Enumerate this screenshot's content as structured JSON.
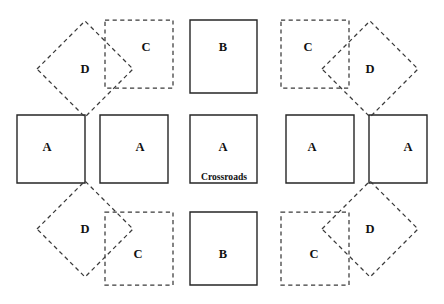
{
  "figure": {
    "name": "crossroads-tiling-diagram",
    "width": 444,
    "height": 304,
    "background_color": "#ffffff",
    "solid_stroke_color": "#262626",
    "dashed_stroke_color": "#3a3a3a",
    "label_color": "#111111",
    "caption": {
      "text": "Crossroads",
      "x": 224,
      "y": 178
    },
    "groups": [
      {
        "name": "left-group",
        "shapes": [
          {
            "id": "left-square-a-west",
            "label": "A",
            "style": "solid",
            "kind": "square",
            "points": "17,115 85,115 85,183 17,183",
            "label_x": 47,
            "label_y": 148
          },
          {
            "id": "left-square-a-east",
            "label": "A",
            "style": "solid",
            "kind": "square",
            "points": "100,115 168,115 168,183 100,183",
            "label_x": 140,
            "label_y": 148
          },
          {
            "id": "left-diamond-d-top",
            "label": "D",
            "style": "dashed",
            "kind": "diamond",
            "points": "37,69 85,21 133,69 85,117",
            "label_x": 85,
            "label_y": 70
          },
          {
            "id": "left-diamond-d-bottom",
            "label": "D",
            "style": "dashed",
            "kind": "diamond",
            "points": "37,229 85,181 133,229 85,277",
            "label_x": 85,
            "label_y": 230
          },
          {
            "id": "left-square-c-top",
            "label": "C",
            "style": "dashed",
            "kind": "square",
            "points": "105,20 173,20 173,88 105,88",
            "label_x": 146,
            "label_y": 48
          },
          {
            "id": "left-square-c-bottom",
            "label": "C",
            "style": "dashed",
            "kind": "square",
            "points": "105,212 173,212 173,285 105,285",
            "label_x": 138,
            "label_y": 255
          }
        ]
      },
      {
        "name": "center-group",
        "shapes": [
          {
            "id": "center-square-b-top",
            "label": "B",
            "style": "solid",
            "kind": "square",
            "points": "190,20 257,20 257,93 190,93",
            "label_x": 223,
            "label_y": 48
          },
          {
            "id": "center-square-a-crossroads",
            "label": "A",
            "style": "solid",
            "kind": "square",
            "points": "190,115 257,115 257,183 190,183",
            "label_x": 223,
            "label_y": 148
          },
          {
            "id": "center-square-b-bottom",
            "label": "B",
            "style": "solid",
            "kind": "square",
            "points": "190,212 257,212 257,285 190,285",
            "label_x": 223,
            "label_y": 255
          }
        ]
      },
      {
        "name": "right-group",
        "shapes": [
          {
            "id": "right-square-a-west",
            "label": "A",
            "style": "solid",
            "kind": "square",
            "points": "286,115 354,115 354,183 286,183",
            "label_x": 312,
            "label_y": 148
          },
          {
            "id": "right-square-a-east",
            "label": "A",
            "style": "solid",
            "kind": "square",
            "points": "369,115 427,115 427,183 369,183",
            "label_x": 408,
            "label_y": 148
          },
          {
            "id": "right-diamond-d-top",
            "label": "D",
            "style": "dashed",
            "kind": "diamond",
            "points": "322,69 370,21 418,69 370,117",
            "label_x": 370,
            "label_y": 70
          },
          {
            "id": "right-diamond-d-bottom",
            "label": "D",
            "style": "dashed",
            "kind": "diamond",
            "points": "322,229 370,181 418,229 370,277",
            "label_x": 370,
            "label_y": 230
          },
          {
            "id": "right-square-c-top",
            "label": "C",
            "style": "dashed",
            "kind": "square",
            "points": "281,20 349,20 349,88 281,88",
            "label_x": 308,
            "label_y": 48
          },
          {
            "id": "right-square-c-bottom",
            "label": "C",
            "style": "dashed",
            "kind": "square",
            "points": "281,212 349,212 349,285 281,285",
            "label_x": 314,
            "label_y": 255
          }
        ]
      }
    ]
  }
}
